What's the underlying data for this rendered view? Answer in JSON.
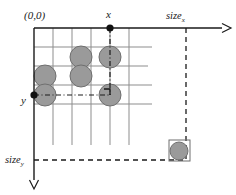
{
  "figure": {
    "title_origin": "(0,0)",
    "label_x": "x",
    "label_y": "y",
    "label_size_x": "size",
    "label_size_x_sub": "x",
    "label_size_y": "size",
    "label_size_y_sub": "y",
    "colors": {
      "circle_fill": "#9a9a9a",
      "circle_stroke": "#6f6f6f",
      "axis": "#1a1a1a",
      "grid": "#8d8d8d",
      "dash": "#1a1a1a",
      "text": "#1a1a1a",
      "background": "#ffffff"
    }
  },
  "geometry": {
    "origin": {
      "x": 34,
      "y": 28
    },
    "axis_x_end": 228,
    "axis_y_end": 188,
    "grid": {
      "cell": 19,
      "v_lines": [
        34,
        53,
        72,
        91,
        110,
        129
      ],
      "v_line_bottom": 145,
      "h_lines": [
        28,
        47,
        66,
        85,
        104
      ],
      "h_line_right_ends": [
        152,
        148,
        133,
        152,
        152
      ]
    },
    "marker_x": {
      "x": 110,
      "y": 28
    },
    "marker_y": {
      "x": 34,
      "y": 95
    },
    "size_x_line": {
      "x": 186,
      "y_from": 28,
      "y_to": 160
    },
    "size_y_line": {
      "y": 160,
      "x_from": 34,
      "x_to": 186
    },
    "dash_vertical_from_x": {
      "x": 110,
      "y_from": 28,
      "y_to": 95
    },
    "dash_horizontal_from_y": {
      "y": 95,
      "x_from": 34,
      "x_to": 110
    }
  },
  "circles": [
    {
      "name": "circle-a",
      "cx": 81,
      "cy": 57,
      "r": 11
    },
    {
      "name": "circle-b",
      "cx": 110,
      "cy": 57,
      "r": 11
    },
    {
      "name": "circle-c",
      "cx": 45,
      "cy": 76,
      "r": 11
    },
    {
      "name": "circle-d",
      "cx": 81,
      "cy": 76,
      "r": 11
    },
    {
      "name": "circle-e",
      "cx": 45,
      "cy": 95,
      "r": 11
    },
    {
      "name": "circle-f",
      "cx": 110,
      "cy": 95,
      "r": 11
    }
  ],
  "corner_cell": {
    "name": "corner-cell",
    "box": {
      "x": 169,
      "y": 140,
      "w": 21,
      "h": 21
    },
    "circle": {
      "cx": 179,
      "cy": 151,
      "r": 9
    }
  }
}
